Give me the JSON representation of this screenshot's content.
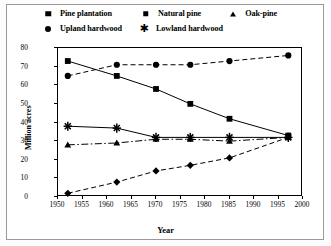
{
  "chart_data": {
    "type": "line",
    "title": "",
    "xlabel": "Year",
    "ylabel": "Million acres",
    "xlim": [
      1950,
      2000
    ],
    "ylim": [
      0,
      80
    ],
    "xticks": [
      1950,
      1955,
      1960,
      1965,
      1970,
      1975,
      1980,
      1985,
      1990,
      1995,
      2000
    ],
    "yticks": [
      0,
      10,
      20,
      30,
      40,
      50,
      60,
      70,
      80
    ],
    "grid": false,
    "legend_position": "top-outside",
    "x": [
      1952,
      1962,
      1970,
      1977,
      1985,
      1997
    ],
    "series": [
      {
        "name": "Pine plantation",
        "marker": "diamond",
        "dash": "dashed",
        "values": [
          2,
          8,
          14,
          17,
          21,
          32
        ]
      },
      {
        "name": "Natural pine",
        "marker": "square",
        "dash": "solid",
        "values": [
          73,
          65,
          58,
          50,
          42,
          33
        ]
      },
      {
        "name": "Oak-pine",
        "marker": "triangle",
        "dash": "dashdot",
        "values": [
          28,
          29,
          31,
          31,
          30,
          32
        ]
      },
      {
        "name": "Upland hardwood",
        "marker": "circle",
        "dash": "dashed",
        "values": [
          65,
          71,
          71,
          71,
          73,
          76
        ]
      },
      {
        "name": "Lowland hardwood",
        "marker": "star",
        "dash": "solid",
        "values": [
          38,
          37,
          32,
          32,
          32,
          32
        ]
      }
    ]
  },
  "legend": {
    "row1": [
      {
        "label": "Pine plantation"
      },
      {
        "label": "Natural pine"
      },
      {
        "label": "Oak-pine"
      }
    ],
    "row2": [
      {
        "label": "Upland hardwood"
      },
      {
        "label": "Lowland hardwood"
      }
    ]
  },
  "axis": {
    "ylabel": "Million acres",
    "xlabel": "Year",
    "yticks": [
      "80",
      "70",
      "60",
      "50",
      "40",
      "30",
      "20",
      "10",
      "0"
    ],
    "xticks": [
      "1950",
      "1955",
      "1960",
      "1965",
      "1970",
      "1975",
      "1980",
      "1985",
      "1990",
      "1995",
      "2000"
    ]
  },
  "colors": {
    "ink": "#000000",
    "frame": "#9a9a9a",
    "background": "#ffffff"
  }
}
